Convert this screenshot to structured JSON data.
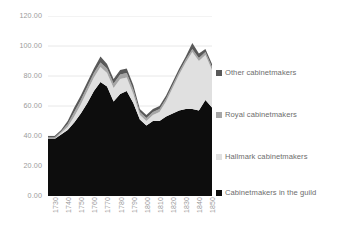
{
  "chart_data": {
    "type": "area",
    "stacked": true,
    "title": "",
    "subtitle": "",
    "xlabel": "",
    "ylabel": "",
    "grid": true,
    "legend_position": "right",
    "ylim": [
      0,
      120
    ],
    "yticks": [
      "0.00",
      "20.00",
      "40.00",
      "60.00",
      "80.00",
      "100.00",
      "120.00"
    ],
    "ytick_values": [
      0,
      20,
      40,
      60,
      80,
      100,
      120
    ],
    "xtick_labels": [
      "1730",
      "1740",
      "1750",
      "1760",
      "1770",
      "1780",
      "1790",
      "1800",
      "1810",
      "1820",
      "1830",
      "1840",
      "1850"
    ],
    "xtick_values": [
      1730,
      1740,
      1750,
      1760,
      1770,
      1780,
      1790,
      1800,
      1810,
      1820,
      1830,
      1840,
      1850
    ],
    "xlim": [
      1730,
      1855
    ],
    "x": [
      1730,
      1735,
      1740,
      1745,
      1750,
      1755,
      1760,
      1765,
      1770,
      1775,
      1780,
      1785,
      1790,
      1795,
      1800,
      1805,
      1810,
      1815,
      1820,
      1825,
      1830,
      1835,
      1840,
      1845,
      1850,
      1855
    ],
    "series": [
      {
        "name": "Cabinetmakers in the guild",
        "color": "#0d0d0d",
        "values": [
          38,
          38,
          41,
          44,
          49,
          55,
          62,
          70,
          76,
          73,
          63,
          68,
          70,
          62,
          51,
          47,
          50,
          50,
          53,
          55,
          57,
          58,
          58,
          57,
          64,
          59
        ]
      },
      {
        "name": "Hallmark cabinetmakers",
        "color": "#e0e0e0",
        "values": [
          0,
          0,
          1,
          2,
          4,
          6,
          8,
          9,
          10,
          9,
          9,
          10,
          9,
          6,
          3,
          3,
          4,
          6,
          10,
          17,
          24,
          31,
          38,
          33,
          30,
          25
        ]
      },
      {
        "name": "Royal cabinetmakers",
        "color": "#a6a6a6",
        "values": [
          1,
          1,
          1,
          2,
          3,
          3,
          3,
          3,
          3,
          3,
          3,
          3,
          3,
          3,
          2,
          2,
          2,
          2,
          2,
          2,
          2,
          2,
          2,
          2,
          2,
          2
        ]
      },
      {
        "name": "Other cabinetmakers",
        "color": "#595959",
        "values": [
          1,
          1,
          1,
          2,
          3,
          3,
          3,
          3,
          4,
          3,
          3,
          3,
          3,
          3,
          2,
          2,
          2,
          2,
          2,
          2,
          2,
          2,
          4,
          3,
          2,
          2
        ]
      }
    ]
  },
  "legend": {
    "items": [
      {
        "label": "Other cabinetmakers",
        "color": "#595959"
      },
      {
        "label": "Royal cabinetmakers",
        "color": "#a6a6a6"
      },
      {
        "label": "Hallmark cabinetmakers",
        "color": "#e0e0e0"
      },
      {
        "label": "Cabinetmakers in the guild",
        "color": "#0d0d0d"
      }
    ]
  },
  "style": {
    "gridline_color": "#e8e8e8",
    "axis_text_color": "#9b9b9b",
    "legend_text_color": "#6d6d6d",
    "background": "#ffffff"
  }
}
